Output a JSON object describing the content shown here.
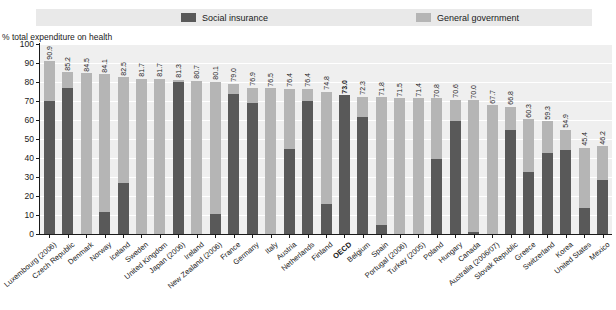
{
  "axis_title": "% total expenditure on health",
  "legend": [
    {
      "key": "social_insurance",
      "label": "Social insurance",
      "color": "#595959"
    },
    {
      "key": "general_government",
      "label": "General government",
      "color": "#b5b5b5"
    }
  ],
  "chart_data": {
    "type": "bar",
    "subtype": "stacked-bar",
    "title": "",
    "xlabel": "",
    "ylabel": "% total expenditure on health",
    "ylim": [
      0,
      100
    ],
    "yticks": [
      0,
      10,
      20,
      30,
      40,
      50,
      60,
      70,
      80,
      90,
      100
    ],
    "grid": true,
    "legend_position": "top",
    "categories": [
      "Luxembourg (2006)",
      "Czech Republic",
      "Denmark",
      "Norway",
      "Iceland",
      "Sweden",
      "United Kingdom",
      "Japan (2006)",
      "Ireland",
      "New Zealand (2006)",
      "France",
      "Germany",
      "Italy",
      "Austria",
      "Netherlands",
      "Finland",
      "OECD",
      "Belgium",
      "Spain",
      "Portugal (2006)",
      "Turkey (2005)",
      "Poland",
      "Hungary",
      "Canada",
      "Australia (2006/07)",
      "Slovak Republic",
      "Greece",
      "Switzerland",
      "Korea",
      "United States",
      "Mexico"
    ],
    "highlight_category": "OECD",
    "series": [
      {
        "name": "Social insurance",
        "color": "#595959",
        "values": [
          70.2,
          76.8,
          0.0,
          11.8,
          26.8,
          0.0,
          0.0,
          79.8,
          0.0,
          10.6,
          73.7,
          68.7,
          0.0,
          44.9,
          70.2,
          15.9,
          73.0,
          61.7,
          4.7,
          0.0,
          0.0,
          39.3,
          59.6,
          1.3,
          0.0,
          55.0,
          32.5,
          42.7,
          44.4,
          13.8,
          28.2
        ]
      },
      {
        "name": "General government",
        "color": "#b5b5b5",
        "values": [
          20.7,
          8.4,
          84.5,
          72.3,
          55.7,
          81.7,
          81.7,
          1.5,
          80.7,
          69.5,
          5.3,
          8.2,
          76.9,
          31.6,
          6.2,
          58.7,
          0.0,
          10.6,
          67.6,
          71.8,
          71.5,
          32.1,
          11.2,
          69.3,
          67.7,
          11.8,
          27.8,
          16.6,
          10.5,
          31.6,
          18.0
        ]
      }
    ],
    "totals": [
      90.9,
      85.2,
      84.5,
      84.1,
      82.5,
      81.7,
      81.7,
      81.3,
      80.7,
      80.1,
      79.0,
      76.9,
      76.5,
      76.4,
      76.4,
      74.8,
      73.0,
      72.3,
      71.8,
      71.5,
      71.4,
      70.8,
      70.6,
      70.0,
      67.7,
      66.8,
      60.3,
      59.3,
      54.9,
      45.4,
      46.2
    ],
    "total_labels": [
      "90.9",
      "85.2",
      "84.5",
      "84.1",
      "82.5",
      "81.7",
      "81.7",
      "81.3",
      "80.7",
      "80.1",
      "79.0",
      "76.9",
      "76.5",
      "76.4",
      "76.4",
      "74.8",
      "73.0",
      "72.3",
      "71.8",
      "71.5",
      "71.4",
      "70.8",
      "70.6",
      "70.0",
      "67.7",
      "66.8",
      "60.3",
      "59.3",
      "54.9",
      "45.4",
      "46.2"
    ]
  }
}
